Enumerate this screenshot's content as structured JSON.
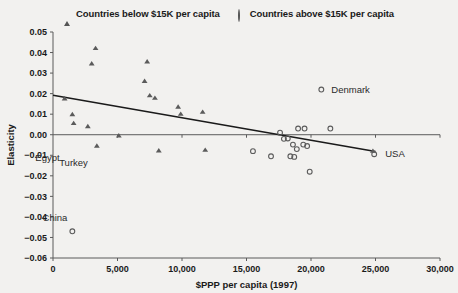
{
  "legend": {
    "entries": [
      {
        "marker": "triangle-icon",
        "label": "Countries below $15K per capita"
      },
      {
        "marker": "circle-icon",
        "label": "Countries above $15K per capita"
      }
    ]
  },
  "chart_data": {
    "type": "scatter",
    "title": "",
    "xlabel": "$PPP per capita (1997)",
    "ylabel": "Elasticity",
    "xlim": [
      0,
      30000
    ],
    "ylim": [
      -0.06,
      0.05
    ],
    "xticks": [
      0,
      5000,
      10000,
      15000,
      20000,
      25000,
      30000
    ],
    "xticklabels": [
      "0",
      "5,000",
      "10,000",
      "15,000",
      "20,000",
      "25,000",
      "30,000"
    ],
    "yticks": [
      0.05,
      0.04,
      0.03,
      0.02,
      0.01,
      0.0,
      -0.01,
      -0.02,
      -0.03,
      -0.04,
      -0.05,
      -0.06
    ],
    "yticklabels": [
      "0.05",
      "0.04",
      "0.03",
      "0.02",
      "0.01",
      "0.00",
      "−0.01",
      "−0.02",
      "−0.03",
      "−0.04",
      "−0.05",
      "−0.06"
    ],
    "grid": false,
    "legend_position": "top-center",
    "series": [
      {
        "name": "Countries below $15K per capita",
        "marker": "triangle",
        "points": [
          [
            900,
            0.0175
          ],
          [
            1500,
            0.0098
          ],
          [
            1600,
            0.0055
          ],
          [
            2700,
            0.004
          ],
          [
            3000,
            0.0345
          ],
          [
            3300,
            0.042
          ],
          [
            3400,
            -0.0055
          ],
          [
            5100,
            -0.0005
          ],
          [
            7100,
            0.026
          ],
          [
            7300,
            0.0355
          ],
          [
            7500,
            0.019
          ],
          [
            7900,
            0.0178
          ],
          [
            8200,
            -0.0078
          ],
          [
            9700,
            0.0135
          ],
          [
            9900,
            0.01
          ],
          [
            11600,
            0.011
          ],
          [
            11800,
            -0.0075
          ],
          [
            24800,
            -0.008
          ]
        ]
      },
      {
        "name": "Countries above $15K per capita",
        "marker": "circle",
        "points": [
          [
            1500,
            -0.047
          ],
          [
            15500,
            -0.008
          ],
          [
            16900,
            -0.0105
          ],
          [
            17600,
            0.001
          ],
          [
            17900,
            -0.002
          ],
          [
            18200,
            -0.0018
          ],
          [
            18400,
            -0.0105
          ],
          [
            18600,
            -0.0048
          ],
          [
            18700,
            -0.0108
          ],
          [
            18900,
            -0.007
          ],
          [
            19000,
            0.003
          ],
          [
            19400,
            -0.0048
          ],
          [
            19500,
            0.003
          ],
          [
            19700,
            -0.0055
          ],
          [
            19900,
            -0.018
          ],
          [
            20800,
            0.022
          ],
          [
            21500,
            0.003
          ],
          [
            24900,
            -0.0095
          ]
        ]
      }
    ],
    "trendline": {
      "x": [
        0,
        25000
      ],
      "y": [
        0.0192,
        -0.0082
      ]
    },
    "annotations": [
      {
        "text": "Denmark",
        "x": 20800,
        "y": 0.022,
        "dx": 10,
        "dy": 3
      },
      {
        "text": "USA",
        "x": 24900,
        "y": -0.0095,
        "dx": 11,
        "dy": 3
      },
      {
        "text": "China",
        "x": 1500,
        "y": -0.047,
        "dx": -5,
        "dy": -10
      },
      {
        "text": "Egypt",
        "x": 900,
        "y": -0.013,
        "dx": -5,
        "dy": 0
      },
      {
        "text": "Turkey",
        "x": 3400,
        "y": -0.015,
        "dx": -9,
        "dy": 0
      }
    ]
  }
}
